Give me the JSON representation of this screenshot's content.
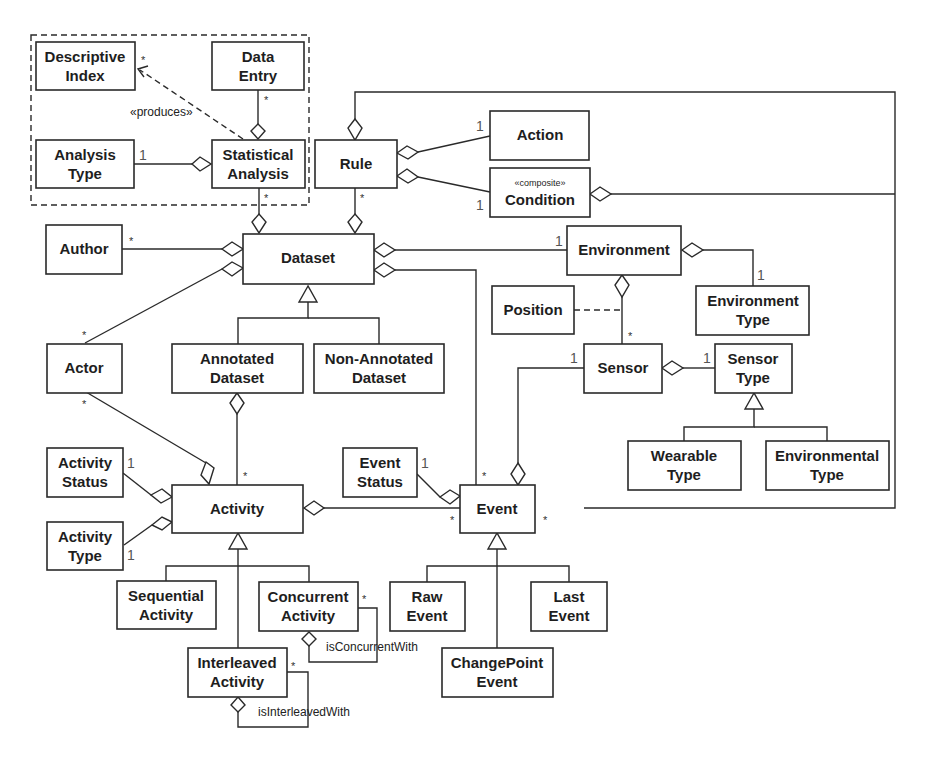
{
  "diagram": {
    "type": "UML class diagram",
    "package_box": {
      "style": "dashed",
      "contains": [
        "Descriptive Index",
        "Data Entry",
        "Analysis Type",
        "Statistical Analysis"
      ]
    },
    "classes": {
      "descriptive_index": {
        "line1": "Descriptive",
        "line2": "Index"
      },
      "data_entry": {
        "line1": "Data",
        "line2": "Entry"
      },
      "analysis_type": {
        "line1": "Analysis",
        "line2": "Type"
      },
      "statistical_analysis": {
        "line1": "Statistical",
        "line2": "Analysis"
      },
      "rule": {
        "line1": "Rule"
      },
      "action": {
        "line1": "Action"
      },
      "condition": {
        "stereotype": "«composite»",
        "line1": "Condition"
      },
      "author": {
        "line1": "Author"
      },
      "dataset": {
        "line1": "Dataset"
      },
      "environment": {
        "line1": "Environment"
      },
      "position": {
        "line1": "Position"
      },
      "environment_type": {
        "line1": "Environment",
        "line2": "Type"
      },
      "actor": {
        "line1": "Actor"
      },
      "annotated_dataset": {
        "line1": "Annotated",
        "line2": "Dataset"
      },
      "non_annotated_dataset": {
        "line1": "Non-Annotated",
        "line2": "Dataset"
      },
      "sensor": {
        "line1": "Sensor"
      },
      "sensor_type": {
        "line1": "Sensor",
        "line2": "Type"
      },
      "wearable_type": {
        "line1": "Wearable",
        "line2": "Type"
      },
      "environmental_type": {
        "line1": "Environmental",
        "line2": "Type"
      },
      "activity_status": {
        "line1": "Activity",
        "line2": "Status"
      },
      "activity_type": {
        "line1": "Activity",
        "line2": "Type"
      },
      "activity": {
        "line1": "Activity"
      },
      "event_status": {
        "line1": "Event",
        "line2": "Status"
      },
      "event": {
        "line1": "Event"
      },
      "sequential_activity": {
        "line1": "Sequential",
        "line2": "Activity"
      },
      "concurrent_activity": {
        "line1": "Concurrent",
        "line2": "Activity"
      },
      "interleaved_activity": {
        "line1": "Interleaved",
        "line2": "Activity"
      },
      "raw_event": {
        "line1": "Raw",
        "line2": "Event"
      },
      "last_event": {
        "line1": "Last",
        "line2": "Event"
      },
      "changepoint_event": {
        "line1": "ChangePoint",
        "line2": "Event"
      }
    },
    "labels": {
      "produces": "«produces»",
      "is_concurrent_with": "isConcurrentWith",
      "is_interleaved_with": "isInterleavedWith"
    },
    "multiplicities": {
      "one": "1",
      "many": "*"
    }
  }
}
